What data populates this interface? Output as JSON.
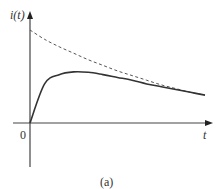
{
  "chart_data": {
    "type": "line",
    "title": "",
    "caption": "(a)",
    "xlabel": "t",
    "ylabel": "i(t)",
    "origin_label": "0",
    "grid": false,
    "legend": "none",
    "series": [
      {
        "name": "i(t) response",
        "style": "solid",
        "description": "rises from 0, peaks, then decays toward the dashed envelope",
        "x": [
          0,
          0.5,
          1,
          1.5,
          2,
          2.5,
          3,
          3.5,
          4,
          4.5,
          5,
          5.5,
          6
        ],
        "values": [
          0,
          0.42,
          0.52,
          0.55,
          0.545,
          0.52,
          0.49,
          0.46,
          0.42,
          0.39,
          0.36,
          0.33,
          0.3
        ]
      },
      {
        "name": "exponential envelope",
        "style": "dashed",
        "description": "exponential decay starting at max value",
        "x": [
          0,
          0.5,
          1,
          1.5,
          2,
          2.5,
          3,
          3.5,
          4,
          4.5,
          5,
          5.5,
          6
        ],
        "values": [
          1.0,
          0.9,
          0.82,
          0.75,
          0.68,
          0.62,
          0.56,
          0.51,
          0.46,
          0.41,
          0.37,
          0.33,
          0.3
        ]
      }
    ],
    "axis_ranges": {
      "x": [
        0,
        6
      ],
      "y": [
        -0.45,
        1.0
      ]
    }
  },
  "labels": {
    "y_axis": "i(t)",
    "x_axis": "t",
    "origin": "0",
    "caption": "(a)"
  }
}
